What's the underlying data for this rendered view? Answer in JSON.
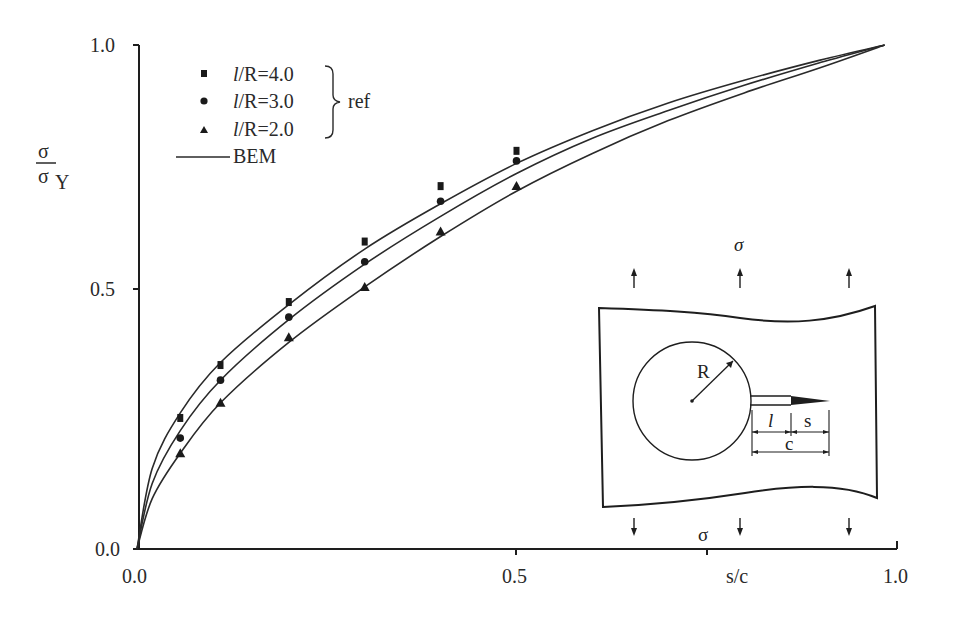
{
  "chart_data": {
    "type": "line",
    "title": "",
    "xlabel": "s/c",
    "ylabel": "σ / σ_Y",
    "xlim": [
      0.0,
      1.0
    ],
    "ylim": [
      0.0,
      1.0
    ],
    "x_ticks": [
      "0.0",
      "0.5",
      "1.0"
    ],
    "y_ticks": [
      "0.0",
      "0.5",
      "1.0"
    ],
    "grid": false,
    "legend_position": "upper-left",
    "legend": {
      "ref_group_label": "ref",
      "entries": [
        {
          "marker": "square",
          "label_prefix": "l",
          "label_rest": "/R=4.0"
        },
        {
          "marker": "circle",
          "label_prefix": "l",
          "label_rest": "/R=3.0"
        },
        {
          "marker": "triangle",
          "label_prefix": "l",
          "label_rest": "/R=2.0"
        },
        {
          "marker": "line",
          "label_prefix": "",
          "label_rest": "BEM"
        }
      ]
    },
    "series": [
      {
        "name": "l/R=4.0 (ref)",
        "kind": "markers",
        "marker": "square",
        "x": [
          0.057,
          0.11,
          0.2,
          0.3,
          0.4,
          0.5
        ],
        "y": [
          0.26,
          0.365,
          0.49,
          0.61,
          0.72,
          0.79
        ]
      },
      {
        "name": "l/R=3.0 (ref)",
        "kind": "markers",
        "marker": "circle",
        "x": [
          0.057,
          0.11,
          0.2,
          0.3,
          0.4,
          0.5
        ],
        "y": [
          0.22,
          0.335,
          0.46,
          0.57,
          0.69,
          0.77
        ]
      },
      {
        "name": "l/R=2.0 (ref)",
        "kind": "markers",
        "marker": "triangle",
        "x": [
          0.057,
          0.11,
          0.2,
          0.3,
          0.4,
          0.5
        ],
        "y": [
          0.19,
          0.29,
          0.42,
          0.52,
          0.63,
          0.72
        ]
      },
      {
        "name": "BEM l/R=4.0",
        "kind": "line",
        "x": [
          0.0,
          0.02,
          0.057,
          0.11,
          0.2,
          0.3,
          0.4,
          0.5,
          0.6,
          0.7,
          0.8,
          0.9,
          0.985
        ],
        "y": [
          0.0,
          0.16,
          0.27,
          0.37,
          0.485,
          0.595,
          0.685,
          0.765,
          0.83,
          0.885,
          0.93,
          0.97,
          1.0
        ]
      },
      {
        "name": "BEM l/R=3.0",
        "kind": "line",
        "x": [
          0.0,
          0.02,
          0.057,
          0.11,
          0.2,
          0.3,
          0.4,
          0.5,
          0.6,
          0.7,
          0.8,
          0.9,
          0.985
        ],
        "y": [
          0.0,
          0.13,
          0.235,
          0.335,
          0.455,
          0.565,
          0.66,
          0.745,
          0.815,
          0.87,
          0.92,
          0.965,
          1.0
        ]
      },
      {
        "name": "BEM l/R=2.0",
        "kind": "line",
        "x": [
          0.0,
          0.02,
          0.057,
          0.11,
          0.2,
          0.3,
          0.4,
          0.5,
          0.6,
          0.7,
          0.8,
          0.9,
          0.985
        ],
        "y": [
          0.0,
          0.1,
          0.19,
          0.29,
          0.41,
          0.52,
          0.62,
          0.71,
          0.785,
          0.85,
          0.905,
          0.955,
          1.0
        ]
      }
    ],
    "inset": {
      "description": "plate with circular hole of radius R and edge crack of length c = l + s under remote stress σ",
      "labels": {
        "radius": "R",
        "crack_l": "l",
        "crack_s": "s",
        "crack_c": "c",
        "stress_top": "σ",
        "stress_bottom": "σ"
      }
    }
  }
}
